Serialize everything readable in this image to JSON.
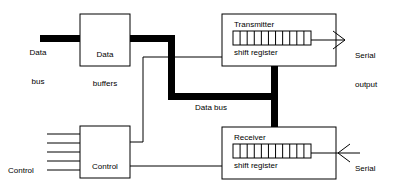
{
  "diagram": {
    "colors": {
      "stroke": "#000000",
      "box_fill": "#ffffff",
      "bus": "#000000",
      "background": "#ffffff"
    },
    "boxes": [
      {
        "id": "data-buffers",
        "label_line1": "Data",
        "label_line2": "buffers",
        "x": 80,
        "y": 14,
        "w": 50,
        "h": 52
      },
      {
        "id": "control-unit",
        "label_line1": "Control",
        "label_line2": "unit",
        "x": 80,
        "y": 126,
        "w": 50,
        "h": 52
      },
      {
        "id": "transmitter",
        "title": "Transmitter",
        "subtitle": "shift register",
        "x": 222,
        "y": 14,
        "w": 114,
        "h": 52
      },
      {
        "id": "receiver",
        "title": "Receiver",
        "subtitle": "shift register",
        "x": 222,
        "y": 127,
        "w": 114,
        "h": 52
      }
    ],
    "labels": {
      "data_bus_in_line1": "Data",
      "data_bus_in_line2": "bus",
      "data_bus_mid": "Data bus",
      "control_lines_line1": "Control",
      "control_lines_line2": "lines",
      "serial_output_line1": "Serial",
      "serial_output_line2": "output",
      "serial_input_line1": "Serial",
      "serial_input_line2": "input",
      "transmitter_title": "Transmitter",
      "transmitter_subtitle": "shift register",
      "receiver_title": "Receiver",
      "receiver_subtitle": "shift register",
      "data_buffers_line1": "Data",
      "data_buffers_line2": "buffers",
      "control_unit_line1": "Control",
      "control_unit_line2": "unit"
    },
    "shift_registers": {
      "cell_count": 11,
      "transmitter": {
        "x": 233,
        "y": 31,
        "w": 78,
        "h": 14
      },
      "receiver": {
        "x": 233,
        "y": 144,
        "w": 78,
        "h": 14
      }
    },
    "control_lines": {
      "count": 5,
      "x_start": 47,
      "x_end": 80,
      "y_values": [
        134,
        143,
        152,
        161,
        170
      ]
    },
    "arrows": {
      "serial_output": {
        "direction": "right",
        "tip_x": 345,
        "y": 40
      },
      "serial_input": {
        "direction": "left",
        "tip_x": 338,
        "y": 153
      }
    }
  }
}
